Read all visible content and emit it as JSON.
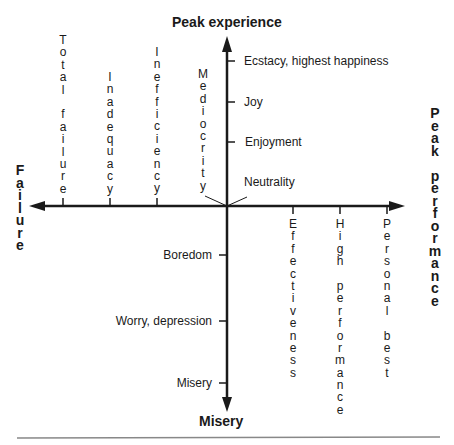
{
  "axes": {
    "top_title": "Peak experience",
    "bottom_title": "Misery",
    "left_title": "Failure",
    "right_title": "Peak performance"
  },
  "upper_y_labels": [
    {
      "label": "Ecstacy, highest happiness",
      "y": 61
    },
    {
      "label": "Joy",
      "y": 102
    },
    {
      "label": "Enjoyment",
      "y": 142
    },
    {
      "label": "Neutrality",
      "y": 182
    }
  ],
  "lower_y_labels": [
    {
      "label": "Boredom",
      "y": 255
    },
    {
      "label": "Worry, depression",
      "y": 321
    },
    {
      "label": "Misery",
      "y": 383
    }
  ],
  "left_x_labels": [
    {
      "label": "Total failure",
      "x": 63
    },
    {
      "label": "Inadequacy",
      "x": 110
    },
    {
      "label": "Inefficiency",
      "x": 157
    },
    {
      "label": "Mediocrity",
      "x": 203
    }
  ],
  "right_x_labels": [
    {
      "label": "Effectiveness",
      "x": 293
    },
    {
      "label": "High performance",
      "x": 340
    },
    {
      "label": "Personal best",
      "x": 387
    }
  ],
  "colors": {
    "ink": "#1a1a1a",
    "rule": "#888888"
  }
}
